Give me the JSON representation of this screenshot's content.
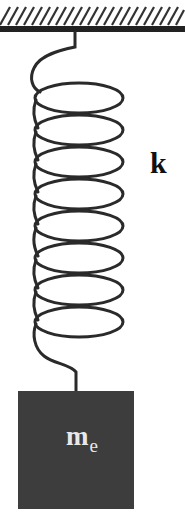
{
  "diagram": {
    "type": "mass-spring system",
    "ceiling": {
      "hatch_count": 22,
      "color": "#222222"
    },
    "spring": {
      "label": "k",
      "coil_count": 8,
      "color": "#2a2a2a"
    },
    "mass": {
      "label_main": "m",
      "label_subscript": "e",
      "fill": "#3d3d3d",
      "text_color": "#e8e8e8"
    }
  }
}
